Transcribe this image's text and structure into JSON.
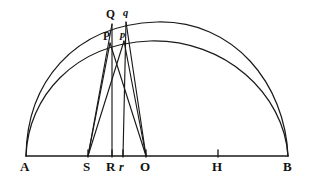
{
  "figure": {
    "stroke_color": "#1a1a18",
    "background_color": "#ffffff",
    "width": 312,
    "height": 185
  },
  "baseline": {
    "name": "major-axis-AB",
    "y": 156,
    "x_start": 26,
    "x_end": 288
  },
  "points": [
    {
      "id": "A",
      "label": "A",
      "x": 26,
      "y": 156,
      "label_x": 20,
      "label_y": 160,
      "style": "upper",
      "has_tick": false
    },
    {
      "id": "S",
      "label": "S",
      "x": 88,
      "y": 156,
      "label_x": 83,
      "label_y": 160,
      "style": "upper",
      "has_tick": true
    },
    {
      "id": "R",
      "label": "R",
      "x": 112,
      "y": 156,
      "label_x": 106,
      "label_y": 160,
      "style": "upper",
      "has_tick": true
    },
    {
      "id": "r",
      "label": "r",
      "x": 123,
      "y": 156,
      "label_x": 119,
      "label_y": 161,
      "style": "lower",
      "has_tick": true
    },
    {
      "id": "O",
      "label": "O",
      "x": 146,
      "y": 156,
      "label_x": 140,
      "label_y": 160,
      "style": "upper",
      "has_tick": true
    },
    {
      "id": "H",
      "label": "H",
      "x": 218,
      "y": 156,
      "label_x": 212,
      "label_y": 160,
      "style": "upper",
      "has_tick": true
    },
    {
      "id": "B",
      "label": "B",
      "x": 288,
      "y": 156,
      "label_x": 283,
      "label_y": 160,
      "style": "upper",
      "has_tick": false
    },
    {
      "id": "Q",
      "label": "Q",
      "x": 112,
      "y": 24,
      "label_x": 106,
      "label_y": 9,
      "style": "vertex",
      "has_tick": false
    },
    {
      "id": "q",
      "label": "q",
      "x": 126,
      "y": 22,
      "label_x": 123,
      "label_y": 8,
      "style": "vertex-lower",
      "has_tick": false
    },
    {
      "id": "P",
      "label": "P",
      "x": 110,
      "y": 43,
      "label_x": 103,
      "label_y": 31,
      "style": "vertex",
      "has_tick": false
    },
    {
      "id": "p",
      "label": "p",
      "x": 124,
      "y": 41,
      "label_x": 120,
      "label_y": 30,
      "style": "vertex-lower",
      "has_tick": false
    }
  ],
  "arcs": [
    {
      "id": "outer-arc",
      "name": "outer-circle-arc-AQB",
      "d": "M 26 156 C 27 84 72 25 157 22 C 234 20 285 84 288 156"
    },
    {
      "id": "inner-arc",
      "name": "inner-ellipse-arc-APB",
      "d": "M 26 156 C 28 97 74 44 150 41 C 225 39 284 94 288 156"
    }
  ],
  "chords": [
    {
      "id": "SP",
      "name": "chord-S-to-P",
      "x1": 88,
      "y1": 156,
      "x2": 110,
      "y2": 43
    },
    {
      "id": "Sp",
      "name": "chord-S-to-p",
      "x1": 88,
      "y1": 156,
      "x2": 124,
      "y2": 41
    },
    {
      "id": "OP",
      "name": "chord-O-to-P",
      "x1": 146,
      "y1": 156,
      "x2": 110,
      "y2": 43
    },
    {
      "id": "Op",
      "name": "chord-O-to-p",
      "x1": 146,
      "y1": 156,
      "x2": 124,
      "y2": 41
    },
    {
      "id": "QR",
      "name": "perpendicular-Q-to-R",
      "x1": 112,
      "y1": 24,
      "x2": 112,
      "y2": 156
    },
    {
      "id": "qr",
      "name": "perpendicular-q-to-r",
      "x1": 126,
      "y1": 22,
      "x2": 123,
      "y2": 156
    },
    {
      "id": "SQ",
      "name": "chord-S-to-Q",
      "x1": 88,
      "y1": 156,
      "x2": 112,
      "y2": 24
    },
    {
      "id": "Oq",
      "name": "chord-O-to-q",
      "x1": 146,
      "y1": 156,
      "x2": 126,
      "y2": 22
    }
  ],
  "ticks": {
    "height": 6
  }
}
